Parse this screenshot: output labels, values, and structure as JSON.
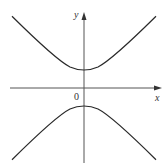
{
  "diagram": {
    "type": "hyperbola",
    "axes": {
      "x_label": "x",
      "y_label": "y",
      "origin_label": "0"
    },
    "colors": {
      "curve": "#2a2a2a",
      "axis": "#555555"
    }
  }
}
